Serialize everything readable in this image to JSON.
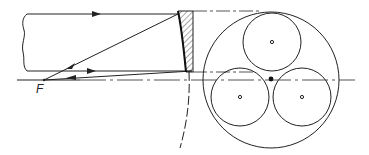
{
  "diagram": {
    "type": "optical-schematic",
    "labels": {
      "focus": "F"
    },
    "colors": {
      "stroke": "#222222",
      "background": "#ffffff"
    },
    "elements": {
      "beam": {
        "top_y": 14,
        "bottom_y": 71,
        "left_x": 27,
        "right_x": 178
      },
      "optical_axis": {
        "y": 80,
        "x_start": 17,
        "x_end": 355
      },
      "focus_point": {
        "x": 44,
        "y": 80
      },
      "mirror": {
        "x_left": 177,
        "x_right": 193,
        "y_top": 11,
        "y_bottom": 72
      },
      "aperture": {
        "outer_circle": {
          "cx": 271,
          "cy": 80,
          "r": 68
        },
        "sub_apertures": [
          {
            "name": "top",
            "cx": 272,
            "cy": 42,
            "r": 29
          },
          {
            "name": "bottom-left",
            "cx": 240,
            "cy": 97,
            "r": 29
          },
          {
            "name": "bottom-right",
            "cx": 302,
            "cy": 97,
            "r": 29
          }
        ],
        "center_dot": {
          "cx": 271,
          "cy": 79
        }
      }
    }
  }
}
